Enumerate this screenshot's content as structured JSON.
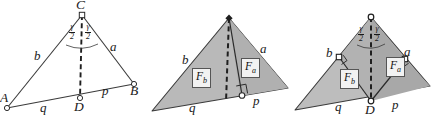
{
  "figure": {
    "background_color": "#ffffff",
    "stroke_color": "#333333",
    "fill_color": "#b9b9b9",
    "fill_color_dark": "#a6a6a6",
    "label_color": "#1a1a1a",
    "box_fill": "#f2f2f2",
    "panels": [
      {
        "name": "panel-1-outline",
        "description": "Triangle ABC with cevian CD, no shading",
        "labels": {
          "vertex_a": "A",
          "vertex_b": "B",
          "vertex_c": "C",
          "vertex_d": "D",
          "side_b": "b",
          "side_a": "a",
          "seg_q": "q",
          "seg_p": "p",
          "angle_left_num": "γ",
          "angle_left_den": "2",
          "angle_right_num": "γ",
          "angle_right_den": "2"
        }
      },
      {
        "name": "panel-2-shaded",
        "description": "Shaded triangle split by cevian into areas F_b and F_a with right angle at foot",
        "labels": {
          "side_b": "b",
          "side_a": "a",
          "seg_q": "q",
          "seg_p": "p",
          "area_b_main": "F",
          "area_b_sub": "b",
          "area_a_main": "F",
          "area_a_sub": "a"
        }
      },
      {
        "name": "panel-3-shaded-bisector",
        "description": "Shaded triangle with bisector, perpendicular feet on sides a and b, areas F_b and F_a",
        "labels": {
          "vertex_d": "D",
          "side_b": "b",
          "side_a": "a",
          "seg_q": "q",
          "seg_p": "p",
          "area_b_main": "F",
          "area_b_sub": "b",
          "area_a_main": "F",
          "area_a_sub": "a",
          "angle_left_num": "γ",
          "angle_left_den": "2",
          "angle_right_num": "γ",
          "angle_right_den": "2"
        }
      }
    ]
  }
}
